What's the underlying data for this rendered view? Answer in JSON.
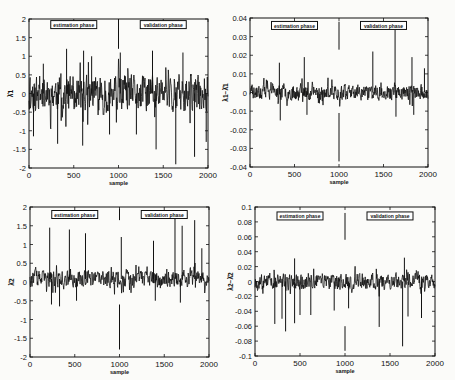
{
  "figure": {
    "background": "#fbfbf9",
    "line_color": "#111111",
    "annotation_labels": [
      "estimation phase",
      "validation phase"
    ]
  },
  "chart_data": [
    {
      "type": "line",
      "id": "tl",
      "title": "",
      "xlabel": "sample",
      "ylabel": "λ̂1",
      "xlim": [
        0,
        2000
      ],
      "ylim": [
        -2,
        2
      ],
      "xticks": [
        0,
        500,
        1000,
        1500,
        2000
      ],
      "yticks": [
        -2,
        -1.5,
        -1,
        -0.5,
        0,
        0.5,
        1,
        1.5,
        2
      ],
      "ytick_labels": [
        "-2",
        "-1.5",
        "-1",
        "-0.5",
        "0",
        "0.5",
        "1",
        "1.5",
        "2"
      ],
      "frame": {
        "x": 29,
        "y": 19,
        "w": 179,
        "h": 149
      },
      "grid": false,
      "noise": {
        "center": 0.0,
        "amp": 0.55,
        "seed": 11
      },
      "spikes": [
        [
          50,
          -1.15
        ],
        [
          160,
          0.8
        ],
        [
          320,
          -1.35
        ],
        [
          420,
          1.2
        ],
        [
          600,
          -1.4
        ],
        [
          610,
          1.15
        ],
        [
          700,
          1.0
        ],
        [
          900,
          -1.1
        ],
        [
          1020,
          1.1
        ],
        [
          1200,
          -1.1
        ],
        [
          1380,
          1.15
        ],
        [
          1420,
          -1.5
        ],
        [
          1640,
          -1.9
        ],
        [
          1720,
          1.1
        ],
        [
          1850,
          -1.7
        ],
        [
          1980,
          -1.3
        ]
      ],
      "divider": {
        "x": 1000,
        "y1": 2.0,
        "y2": 1.2
      },
      "annotations": [
        {
          "text": "estimation phase",
          "x": 500,
          "y": 1.85
        },
        {
          "text": "validation phase",
          "x": 1500,
          "y": 1.85
        }
      ]
    },
    {
      "type": "line",
      "id": "tr",
      "title": "",
      "xlabel": "sample",
      "ylabel": "λ1−λ̂1",
      "xlim": [
        0,
        2000
      ],
      "ylim": [
        -0.04,
        0.04
      ],
      "xticks": [
        0,
        500,
        1000,
        1500,
        2000
      ],
      "yticks": [
        -0.04,
        -0.03,
        -0.02,
        -0.01,
        0,
        0.01,
        0.02,
        0.03,
        0.04
      ],
      "ytick_labels": [
        "-0.04",
        "-0.03",
        "-0.02",
        "-0.01",
        "0",
        "0.01",
        "0.02",
        "0.03",
        "0.04"
      ],
      "frame": {
        "x": 250,
        "y": 18,
        "w": 178,
        "h": 149
      },
      "grid": false,
      "noise": {
        "center": 0.0,
        "amp": 0.0045,
        "seed": 23
      },
      "spikes": [
        [
          330,
          0.016
        ],
        [
          340,
          -0.015
        ],
        [
          610,
          0.019
        ],
        [
          640,
          -0.012
        ],
        [
          1380,
          0.022
        ],
        [
          1630,
          0.038
        ],
        [
          1640,
          -0.013
        ],
        [
          1820,
          0.019
        ],
        [
          1840,
          -0.012
        ],
        [
          1960,
          0.013
        ]
      ],
      "divider": {
        "x": 1000,
        "y1": 0.038,
        "y2": 0.023
      },
      "divider2": {
        "x": 1000,
        "y1": -0.011,
        "y2": -0.037
      },
      "annotations": [
        {
          "text": "estimation phase",
          "x": 500,
          "y": 0.036
        },
        {
          "text": "validation phase",
          "x": 1500,
          "y": 0.036
        }
      ]
    },
    {
      "type": "line",
      "id": "bl",
      "title": "",
      "xlabel": "sample",
      "ylabel": "λ̂2",
      "xlim": [
        0,
        2000
      ],
      "ylim": [
        -2,
        2
      ],
      "xticks": [
        0,
        500,
        1000,
        1500,
        2000
      ],
      "yticks": [
        -2,
        -1.5,
        -1,
        -0.5,
        0,
        0.5,
        1,
        1.5,
        2
      ],
      "ytick_labels": [
        "-2",
        "-1.5",
        "-1",
        "-0.5",
        "0",
        "0.5",
        "1",
        "1.5",
        "2"
      ],
      "frame": {
        "x": 30,
        "y": 207,
        "w": 179,
        "h": 150
      },
      "grid": false,
      "noise": {
        "center": 0.08,
        "amp": 0.25,
        "seed": 37
      },
      "spikes": [
        [
          220,
          1.45
        ],
        [
          240,
          -0.6
        ],
        [
          330,
          -0.65
        ],
        [
          440,
          1.4
        ],
        [
          520,
          -0.5
        ],
        [
          620,
          1.3
        ],
        [
          1020,
          1.2
        ],
        [
          1380,
          1.1
        ],
        [
          1400,
          -0.5
        ],
        [
          1620,
          1.8
        ],
        [
          1680,
          -0.55
        ],
        [
          1700,
          1.5
        ],
        [
          1840,
          1.65
        ],
        [
          1920,
          0.9
        ]
      ],
      "divider": {
        "x": 1000,
        "y1": 1.95,
        "y2": 1.65
      },
      "divider2": {
        "x": 1000,
        "y1": -0.6,
        "y2": -1.8
      },
      "annotations": [
        {
          "text": "estimation phase",
          "x": 500,
          "y": 1.8
        },
        {
          "text": "validation phase",
          "x": 1500,
          "y": 1.8
        }
      ]
    },
    {
      "type": "line",
      "id": "br",
      "title": "",
      "xlabel": "sample",
      "ylabel": "λ2−λ̂2",
      "xlim": [
        0,
        2000
      ],
      "ylim": [
        -0.1,
        0.1
      ],
      "xticks": [
        0,
        500,
        1000,
        1500,
        2000
      ],
      "yticks": [
        -0.1,
        -0.08,
        -0.06,
        -0.04,
        -0.02,
        0,
        0.02,
        0.04,
        0.06,
        0.08,
        0.1
      ],
      "ytick_labels": [
        "-0.1",
        "-0.08",
        "-0.06",
        "-0.04",
        "-0.02",
        "0",
        "0.02",
        "0.04",
        "0.06",
        "0.08",
        "0.1"
      ],
      "frame": {
        "x": 255,
        "y": 207,
        "w": 180,
        "h": 149
      },
      "grid": false,
      "noise": {
        "center": 0.0,
        "amp": 0.012,
        "seed": 53
      },
      "spikes": [
        [
          220,
          -0.057
        ],
        [
          300,
          -0.05
        ],
        [
          340,
          -0.067
        ],
        [
          440,
          -0.056
        ],
        [
          500,
          -0.045
        ],
        [
          620,
          -0.045
        ],
        [
          880,
          -0.039
        ],
        [
          1040,
          -0.036
        ],
        [
          1380,
          -0.061
        ],
        [
          1640,
          -0.087
        ],
        [
          1700,
          -0.047
        ],
        [
          1850,
          -0.049
        ],
        [
          1660,
          0.032
        ],
        [
          440,
          0.031
        ]
      ],
      "divider": {
        "x": 1000,
        "y1": 0.092,
        "y2": 0.056
      },
      "divider2": {
        "x": 1000,
        "y1": -0.06,
        "y2": -0.093
      },
      "annotations": [
        {
          "text": "estimation phase",
          "x": 500,
          "y": 0.088
        },
        {
          "text": "validation phase",
          "x": 1500,
          "y": 0.088
        }
      ]
    }
  ]
}
